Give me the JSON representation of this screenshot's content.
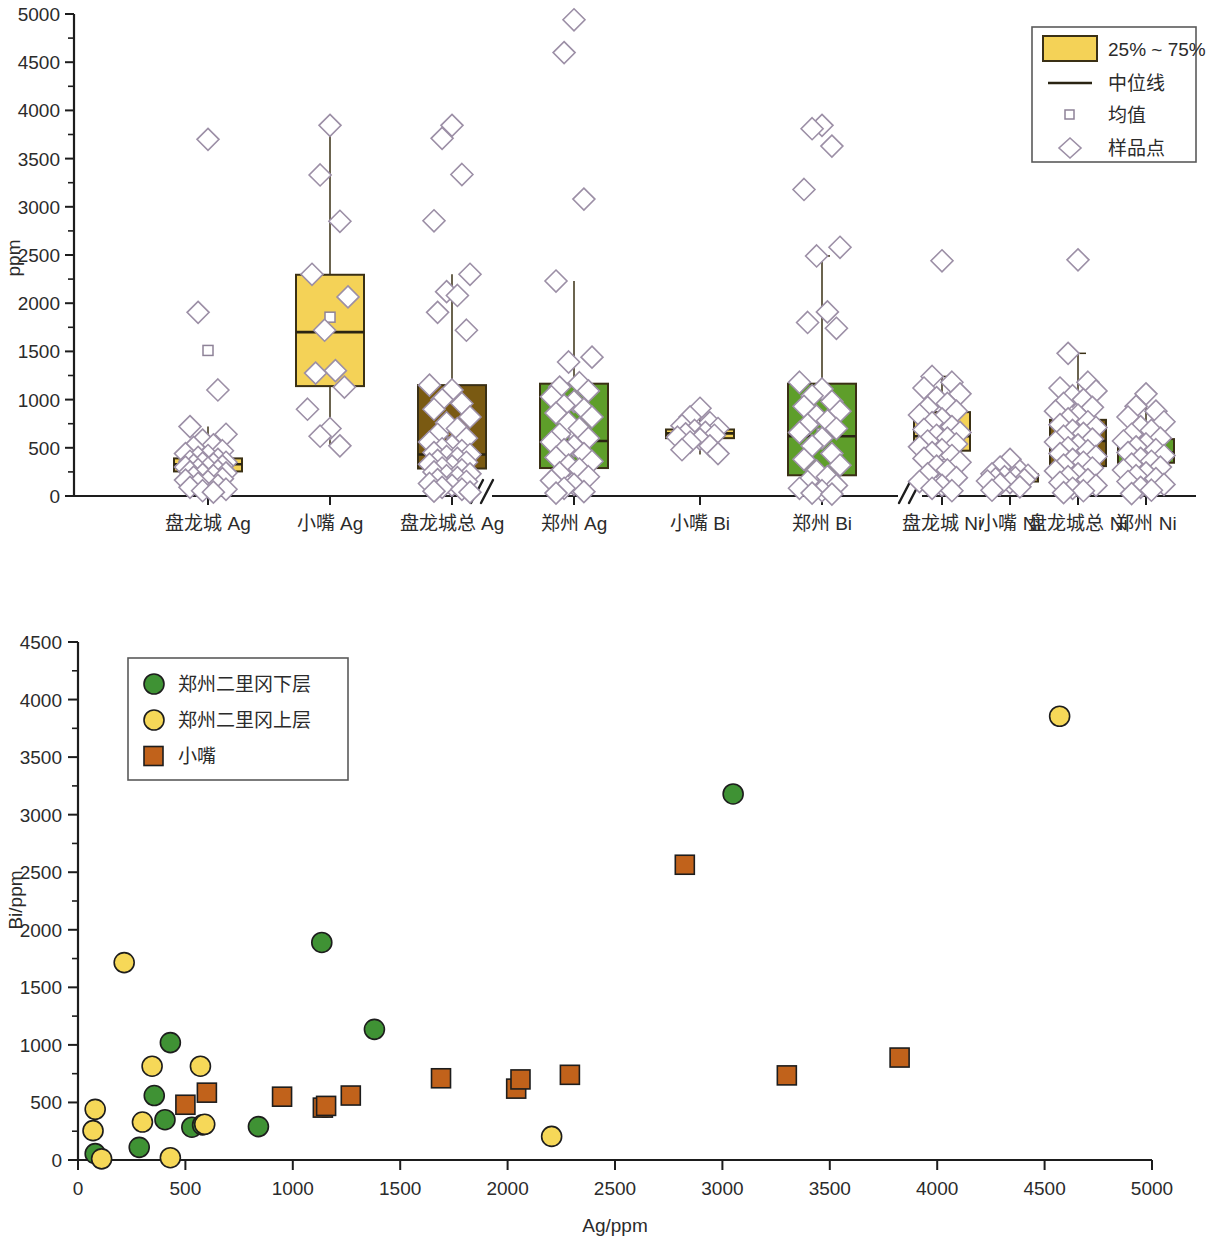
{
  "figure": {
    "panels": [
      "boxplot-panel",
      "scatter-panel"
    ]
  },
  "chart_data": [
    {
      "type": "box",
      "id": "boxplot",
      "title": "",
      "ylabel": "ppm",
      "xlabel": "",
      "ylim": [
        0,
        5000
      ],
      "yticks": [
        0,
        500,
        1000,
        1500,
        2000,
        2500,
        3000,
        3500,
        4000,
        4500,
        5000
      ],
      "grid": false,
      "axis_breaks": 2,
      "legend_position": "top-right",
      "legend": [
        {
          "key": "iqr-swatch",
          "label": "25% ~ 75%",
          "marker": "filled-rect",
          "color": "#f4d257"
        },
        {
          "key": "median-line",
          "label": "中位线",
          "marker": "line",
          "color": "#2a2413"
        },
        {
          "key": "mean-marker",
          "label": "均值",
          "marker": "small-square",
          "color": "#8e8298"
        },
        {
          "key": "sample-marker",
          "label": "样品点",
          "marker": "diamond",
          "color": "#9c8fa6"
        }
      ],
      "groups": [
        {
          "name": "Ag",
          "categories": [
            "盘龙城 Ag",
            "小嘴 Ag",
            "盘龙城总 Ag",
            "郑州 Ag"
          ]
        },
        {
          "name": "Bi",
          "categories": [
            "小嘴 Bi",
            "郑州 Bi"
          ]
        },
        {
          "name": "Ni",
          "categories": [
            "盘龙城 Ni",
            "小嘴 Ni",
            "盘龙城总 Ni",
            "郑州 Ni"
          ]
        }
      ],
      "categories": [
        "盘龙城 Ag",
        "小嘴 Ag",
        "盘龙城总 Ag",
        "郑州 Ag",
        "小嘴 Bi",
        "郑州 Bi",
        "盘龙城 Ni",
        "小嘴 Ni",
        "盘龙城总 Ni",
        "郑州 Ni"
      ],
      "boxes": [
        {
          "category": "盘龙城 Ag",
          "color": "#f4d257",
          "x": 208,
          "q1": 255,
          "q3": 390,
          "median": 330,
          "mean": 1510,
          "whisker_low": 60,
          "whisker_high": 720,
          "points": [
            3700,
            1905,
            1100,
            720,
            640,
            580,
            530,
            505,
            470,
            440,
            420,
            400,
            380,
            360,
            350,
            340,
            330,
            320,
            310,
            300,
            290,
            275,
            260,
            250,
            240,
            225,
            210,
            195,
            180,
            165,
            150,
            130,
            110,
            90,
            70,
            55,
            40
          ]
        },
        {
          "category": "小嘴 Ag",
          "color": "#f4d257",
          "x": 330,
          "q1": 1140,
          "q3": 2295,
          "median": 1700,
          "mean": 1855,
          "whisker_low": 520,
          "whisker_high": 3845,
          "points": [
            3845,
            3330,
            2850,
            2300,
            2065,
            1720,
            1300,
            1275,
            1130,
            900,
            700,
            620,
            520
          ]
        },
        {
          "category": "盘龙城总 Ag",
          "color": "#7a5a12",
          "x": 452,
          "q1": 285,
          "q3": 1150,
          "median": 430,
          "mean": 560,
          "whisker_low": 40,
          "whisker_high": 2300,
          "points": [
            3845,
            3710,
            3335,
            2855,
            2300,
            2120,
            2080,
            1905,
            1720,
            1150,
            1100,
            1000,
            960,
            900,
            820,
            760,
            700,
            640,
            600,
            560,
            520,
            490,
            470,
            450,
            430,
            410,
            390,
            370,
            350,
            330,
            310,
            290,
            270,
            250,
            230,
            210,
            190,
            170,
            150,
            130,
            110,
            90,
            70,
            50,
            40
          ]
        },
        {
          "category": "郑州 Ag",
          "color": "#5e9e2a",
          "x": 574,
          "q1": 290,
          "q3": 1165,
          "median": 570,
          "mean": 620,
          "whisker_low": 30,
          "whisker_high": 2230,
          "points": [
            4940,
            4600,
            3080,
            2230,
            1440,
            1390,
            1175,
            1130,
            1090,
            1030,
            980,
            940,
            900,
            860,
            820,
            760,
            700,
            640,
            600,
            560,
            520,
            480,
            440,
            400,
            360,
            320,
            280,
            240,
            200,
            160,
            120,
            80,
            45,
            30
          ]
        },
        {
          "category": "小嘴 Bi",
          "color": "#f4d257",
          "x": 700,
          "q1": 600,
          "q3": 690,
          "median": 650,
          "mean": 660,
          "whisker_low": 430,
          "whisker_high": 910,
          "points": [
            910,
            820,
            760,
            730,
            700,
            680,
            660,
            645,
            630,
            610,
            590,
            560,
            520,
            480,
            440
          ]
        },
        {
          "category": "郑州 Bi",
          "color": "#5e9e2a",
          "x": 822,
          "q1": 215,
          "q3": 1165,
          "median": 620,
          "mean": 650,
          "whisker_low": 20,
          "whisker_high": 2490,
          "points": [
            3845,
            3810,
            3630,
            3180,
            2580,
            2490,
            1910,
            1800,
            1740,
            1180,
            1110,
            1040,
            980,
            930,
            880,
            830,
            780,
            740,
            700,
            660,
            600,
            520,
            440,
            380,
            320,
            260,
            200,
            150,
            110,
            80,
            55,
            30,
            20
          ]
        },
        {
          "category": "盘龙城 Ni",
          "color": "#f4d257",
          "x": 942,
          "q1": 470,
          "q3": 870,
          "median": 620,
          "mean": 640,
          "whisker_low": 55,
          "whisker_high": 1240,
          "points": [
            2440,
            1240,
            1180,
            1120,
            1060,
            1020,
            960,
            920,
            880,
            840,
            800,
            760,
            720,
            690,
            660,
            630,
            600,
            570,
            540,
            510,
            480,
            450,
            420,
            390,
            350,
            310,
            270,
            230,
            190,
            150,
            110,
            80,
            55
          ]
        },
        {
          "category": "小嘴 Ni",
          "color": "#f4d257",
          "x": 1010,
          "q1": 150,
          "q3": 225,
          "median": 185,
          "mean": 190,
          "whisker_low": 60,
          "whisker_high": 380,
          "points": [
            380,
            300,
            260,
            230,
            215,
            200,
            190,
            180,
            170,
            155,
            140,
            120,
            95,
            60
          ]
        },
        {
          "category": "盘龙城总 Ni",
          "color": "#7a5a12",
          "x": 1078,
          "q1": 310,
          "q3": 790,
          "median": 570,
          "mean": 600,
          "whisker_low": 35,
          "whisker_high": 1480,
          "points": [
            2450,
            1480,
            1180,
            1120,
            1090,
            1040,
            1000,
            960,
            920,
            880,
            840,
            800,
            770,
            740,
            710,
            680,
            650,
            620,
            590,
            560,
            530,
            500,
            470,
            440,
            410,
            380,
            350,
            320,
            290,
            260,
            230,
            200,
            170,
            140,
            110,
            80,
            55,
            35
          ]
        },
        {
          "category": "郑州 Ni",
          "color": "#5e9e2a",
          "x": 1146,
          "q1": 345,
          "q3": 590,
          "median": 450,
          "mean": 460,
          "whisker_low": 25,
          "whisker_high": 1060,
          "points": [
            1060,
            930,
            880,
            820,
            770,
            720,
            680,
            640,
            600,
            570,
            540,
            510,
            480,
            450,
            420,
            390,
            360,
            330,
            300,
            270,
            240,
            210,
            180,
            150,
            120,
            90,
            60,
            25
          ]
        }
      ]
    },
    {
      "type": "scatter",
      "id": "ag-bi-scatter",
      "title": "",
      "xlabel": "Ag/ppm",
      "ylabel": "Bi/ppm",
      "xlim": [
        0,
        5000
      ],
      "ylim": [
        0,
        4500
      ],
      "xticks": [
        0,
        500,
        1000,
        1500,
        2000,
        2500,
        3000,
        3500,
        4000,
        4500,
        5000
      ],
      "yticks": [
        0,
        500,
        1000,
        1500,
        2000,
        2500,
        3000,
        3500,
        4000,
        4500
      ],
      "grid": false,
      "legend_position": "top-left",
      "series": [
        {
          "name": "郑州二里冈下层",
          "marker": "circle",
          "color": "#3f9234",
          "points": [
            [
              80,
              55
            ],
            [
              285,
              110
            ],
            [
              355,
              560
            ],
            [
              405,
              350
            ],
            [
              430,
              1020
            ],
            [
              530,
              285
            ],
            [
              580,
              305
            ],
            [
              840,
              290
            ],
            [
              1135,
              1890
            ],
            [
              1150,
              460
            ],
            [
              1380,
              1135
            ],
            [
              3050,
              3180
            ]
          ]
        },
        {
          "name": "郑州二里冈上层",
          "marker": "circle",
          "color": "#f6d858",
          "points": [
            [
              70,
              255
            ],
            [
              80,
              440
            ],
            [
              110,
              10
            ],
            [
              300,
              330
            ],
            [
              345,
              815
            ],
            [
              430,
              20
            ],
            [
              570,
              815
            ],
            [
              590,
              310
            ],
            [
              2205,
              205
            ],
            [
              215,
              1715
            ],
            [
              4570,
              3855
            ]
          ]
        },
        {
          "name": "小嘴",
          "marker": "square",
          "color": "#c1621b",
          "points": [
            [
              500,
              480
            ],
            [
              600,
              585
            ],
            [
              950,
              550
            ],
            [
              1140,
              455
            ],
            [
              1155,
              470
            ],
            [
              1270,
              560
            ],
            [
              1690,
              710
            ],
            [
              2040,
              620
            ],
            [
              2060,
              700
            ],
            [
              2290,
              740
            ],
            [
              2825,
              2565
            ],
            [
              3300,
              735
            ],
            [
              3825,
              890
            ]
          ]
        }
      ]
    }
  ]
}
